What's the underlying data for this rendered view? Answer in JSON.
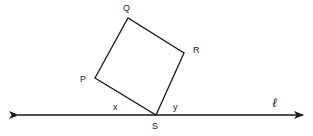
{
  "figure": {
    "type": "geometry-diagram",
    "background_color": "#ffffff",
    "stroke_color": "#1a1a1a",
    "stroke_width": 1.2,
    "canvas": {
      "width": 313,
      "height": 136
    }
  },
  "shape": {
    "name": "quadrilateral-pqrs",
    "vertices": [
      {
        "id": "P",
        "label": "P",
        "x": 95,
        "y": 78,
        "label_x": 80,
        "label_y": 74
      },
      {
        "id": "Q",
        "label": "Q",
        "x": 128,
        "y": 18,
        "label_x": 123,
        "label_y": 3
      },
      {
        "id": "R",
        "label": "R",
        "x": 184,
        "y": 53,
        "label_x": 193,
        "label_y": 45
      },
      {
        "id": "S",
        "label": "S",
        "x": 156,
        "y": 115,
        "label_x": 152,
        "label_y": 121
      }
    ],
    "edges": [
      {
        "from": "P",
        "to": "Q"
      },
      {
        "from": "Q",
        "to": "R"
      },
      {
        "from": "R",
        "to": "S"
      },
      {
        "from": "S",
        "to": "P"
      }
    ],
    "path": "M 95 78 L 128 18 L 184 53 L 156 115 Z"
  },
  "line": {
    "id": "l",
    "label": "ℓ",
    "label_x": 272,
    "label_y": 95,
    "y": 115,
    "x_start": 18,
    "x_end": 303,
    "arrow_both_ends": true
  },
  "angles": [
    {
      "id": "x",
      "label": "x",
      "label_x": 113,
      "label_y": 102,
      "at_vertex": "S",
      "side": "left"
    },
    {
      "id": "y",
      "label": "y",
      "label_x": 173,
      "label_y": 102,
      "at_vertex": "S",
      "side": "right"
    }
  ]
}
